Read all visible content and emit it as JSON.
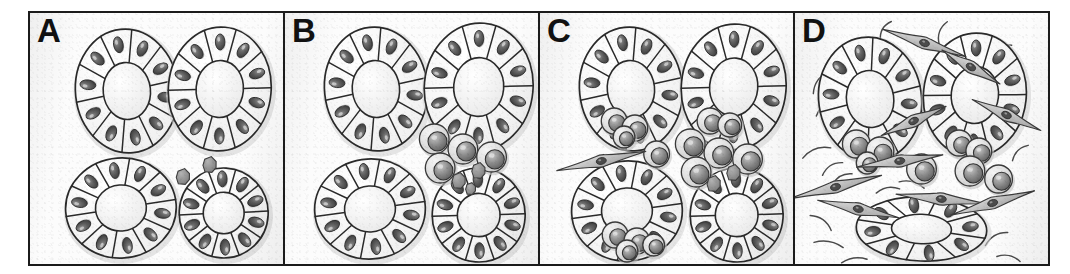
{
  "figure": {
    "panel_count": 4,
    "frame_color": "#1b1b1b",
    "background_color": "#fcfcfc"
  },
  "legend": {
    "acinus": "glandular acinus (ring of wedge-shaped epithelial cells around a central lumen)",
    "epithelial_nucleus": "dark oval basal nucleus",
    "lymphocyte": "round mononuclear infiltrating cell with pale cytoplasm and large nucleus",
    "plasma_cell": "small dark polygonal infiltrating cell",
    "fibroblast": "spindle-shaped cell with tapering processes",
    "collagen_fiber": "curved stromal fiber strand"
  },
  "panels": [
    {
      "id": "A",
      "label": "A",
      "stage": "normal",
      "description": "Four intact acini; two small dark infiltrating cells just appearing at the edge of one acinus",
      "counts": {
        "acini": 4,
        "lymphocytes": 0,
        "plasma_cells": 2,
        "fibroblasts": 0,
        "collagen_fibers": 0
      },
      "acini": [
        {
          "cx": 98,
          "cy": 78,
          "rx": 52,
          "ry": 62,
          "rot": -6,
          "cells": 10,
          "shape": "oval",
          "infiltrated": false
        },
        {
          "cx": 192,
          "cy": 76,
          "rx": 52,
          "ry": 62,
          "rot": 5,
          "cells": 10,
          "shape": "oval",
          "infiltrated": false
        },
        {
          "cx": 92,
          "cy": 195,
          "rx": 56,
          "ry": 50,
          "rot": -4,
          "cells": 10,
          "shape": "oval",
          "infiltrated": false
        },
        {
          "cx": 196,
          "cy": 200,
          "rx": 45,
          "ry": 45,
          "rot": 3,
          "cells": 10,
          "shape": "round",
          "infiltrated": false
        }
      ],
      "lymphocytes": [],
      "plasma_cells": [
        {
          "cx": 155,
          "cy": 164,
          "r": 8
        },
        {
          "cx": 182,
          "cy": 152,
          "r": 8
        }
      ],
      "fibroblasts": [],
      "collagen_fibers": []
    },
    {
      "id": "B",
      "label": "B",
      "stage": "early periductal infiltrate",
      "description": "Four intact acini with a focal cluster of mononuclear cells between them",
      "counts": {
        "acini": 4,
        "lymphocytes": 5,
        "plasma_cells": 3,
        "fibroblasts": 0,
        "collagen_fibers": 0
      },
      "acini": [
        {
          "cx": 92,
          "cy": 76,
          "rx": 52,
          "ry": 62,
          "rot": -6,
          "cells": 10,
          "shape": "oval",
          "infiltrated": false
        },
        {
          "cx": 196,
          "cy": 74,
          "rx": 55,
          "ry": 64,
          "rot": 5,
          "cells": 10,
          "shape": "oval",
          "infiltrated": false
        },
        {
          "cx": 86,
          "cy": 196,
          "rx": 56,
          "ry": 50,
          "rot": -3,
          "cells": 10,
          "shape": "oval",
          "infiltrated": false
        },
        {
          "cx": 196,
          "cy": 202,
          "rx": 47,
          "ry": 47,
          "rot": 4,
          "cells": 10,
          "shape": "round",
          "infiltrated": false
        }
      ],
      "lymphocytes": [
        {
          "cx": 151,
          "cy": 126,
          "r": 15
        },
        {
          "cx": 180,
          "cy": 136,
          "r": 15
        },
        {
          "cx": 209,
          "cy": 144,
          "r": 15
        },
        {
          "cx": 157,
          "cy": 155,
          "r": 15
        },
        {
          "cx": 186,
          "cy": 120,
          "r": 0
        }
      ],
      "plasma_cells": [
        {
          "cx": 196,
          "cy": 158,
          "r": 8
        },
        {
          "cx": 176,
          "cy": 168,
          "r": 8
        },
        {
          "cx": 188,
          "cy": 176,
          "r": 6
        }
      ],
      "fibroblasts": [],
      "collagen_fibers": []
    },
    {
      "id": "C",
      "label": "C",
      "stage": "expanded infiltrate with acinar invasion",
      "description": "Infiltrating cells increase, invade the walls of two acini; an early fibroblast appears",
      "counts": {
        "acini": 4,
        "lymphocytes": 14,
        "plasma_cells": 2,
        "fibroblasts": 1,
        "collagen_fibers": 0
      },
      "acini": [
        {
          "cx": 92,
          "cy": 76,
          "rx": 52,
          "ry": 62,
          "rot": -6,
          "cells": 10,
          "shape": "oval",
          "infiltrated": true
        },
        {
          "cx": 196,
          "cy": 74,
          "rx": 53,
          "ry": 63,
          "rot": 5,
          "cells": 10,
          "shape": "oval",
          "infiltrated": true
        },
        {
          "cx": 88,
          "cy": 198,
          "rx": 56,
          "ry": 50,
          "rot": -3,
          "cells": 10,
          "shape": "oval",
          "infiltrated": true
        },
        {
          "cx": 199,
          "cy": 202,
          "rx": 47,
          "ry": 47,
          "rot": 4,
          "cells": 10,
          "shape": "round",
          "infiltrated": false
        }
      ],
      "lymphocytes": [
        {
          "cx": 152,
          "cy": 131,
          "r": 15
        },
        {
          "cx": 181,
          "cy": 140,
          "r": 15
        },
        {
          "cx": 210,
          "cy": 146,
          "r": 15
        },
        {
          "cx": 158,
          "cy": 159,
          "r": 15
        },
        {
          "cx": 118,
          "cy": 141,
          "r": 13
        },
        {
          "cx": 75,
          "cy": 108,
          "r": 13
        },
        {
          "cx": 96,
          "cy": 115,
          "r": 13
        },
        {
          "cx": 85,
          "cy": 124,
          "r": 11
        },
        {
          "cx": 172,
          "cy": 108,
          "r": 13
        },
        {
          "cx": 192,
          "cy": 112,
          "r": 12
        },
        {
          "cx": 76,
          "cy": 222,
          "r": 13
        },
        {
          "cx": 98,
          "cy": 228,
          "r": 13
        },
        {
          "cx": 115,
          "cy": 232,
          "r": 11
        },
        {
          "cx": 88,
          "cy": 238,
          "r": 11
        }
      ],
      "plasma_cells": [
        {
          "cx": 196,
          "cy": 160,
          "r": 8
        },
        {
          "cx": 176,
          "cy": 171,
          "r": 8
        }
      ],
      "fibroblasts": [
        {
          "cx": 62,
          "cy": 148,
          "len": 46,
          "rot": -12
        }
      ],
      "collagen_fibers": []
    },
    {
      "id": "D",
      "label": "D",
      "stage": "fibrosis and acinar atrophy",
      "description": "Dense fibroblasts and collagen fibers replace the stroma; only three acini remain, the lower one flattened and atrophic",
      "counts": {
        "acini": 3,
        "lymphocytes": 9,
        "plasma_cells": 0,
        "fibroblasts": 9,
        "collagen_fibers": 22
      },
      "acini": [
        {
          "cx": 76,
          "cy": 86,
          "rx": 52,
          "ry": 62,
          "rot": -8,
          "cells": 10,
          "shape": "oval",
          "infiltrated": true
        },
        {
          "cx": 182,
          "cy": 82,
          "rx": 52,
          "ry": 62,
          "rot": 6,
          "cells": 10,
          "shape": "oval",
          "infiltrated": true
        },
        {
          "cx": 128,
          "cy": 216,
          "rx": 66,
          "ry": 32,
          "rot": 2,
          "cells": 8,
          "shape": "flattened",
          "infiltrated": false
        }
      ],
      "lymphocytes": [
        {
          "cx": 62,
          "cy": 131,
          "r": 14
        },
        {
          "cx": 86,
          "cy": 138,
          "r": 14
        },
        {
          "cx": 73,
          "cy": 150,
          "r": 11
        },
        {
          "cx": 128,
          "cy": 156,
          "r": 15
        },
        {
          "cx": 166,
          "cy": 130,
          "r": 13
        },
        {
          "cx": 186,
          "cy": 138,
          "r": 13
        },
        {
          "cx": 177,
          "cy": 158,
          "r": 15
        },
        {
          "cx": 206,
          "cy": 166,
          "r": 14
        },
        {
          "cx": 152,
          "cy": 121,
          "r": 0
        }
      ],
      "plasma_cells": [],
      "fibroblasts": [
        {
          "cx": 131,
          "cy": 30,
          "len": 44,
          "rot": 18
        },
        {
          "cx": 41,
          "cy": 174,
          "len": 48,
          "rot": -14
        },
        {
          "cx": 64,
          "cy": 196,
          "len": 42,
          "rot": 12
        },
        {
          "cx": 106,
          "cy": 148,
          "len": 44,
          "rot": -8
        },
        {
          "cx": 148,
          "cy": 186,
          "len": 46,
          "rot": 6
        },
        {
          "cx": 200,
          "cy": 190,
          "len": 44,
          "rot": -16
        },
        {
          "cx": 214,
          "cy": 102,
          "len": 38,
          "rot": 24
        },
        {
          "cx": 120,
          "cy": 108,
          "len": 36,
          "rot": -24
        },
        {
          "cx": 178,
          "cy": 54,
          "len": 34,
          "rot": 30
        }
      ],
      "collagen_fibers": [
        {
          "x": 26,
          "y": 70,
          "len": 26,
          "rot": -55,
          "curve": 8
        },
        {
          "x": 30,
          "y": 96,
          "len": 22,
          "rot": -40,
          "curve": 7
        },
        {
          "x": 22,
          "y": 140,
          "len": 30,
          "rot": -20,
          "curve": 9
        },
        {
          "x": 26,
          "y": 210,
          "len": 26,
          "rot": 35,
          "curve": 8
        },
        {
          "x": 34,
          "y": 232,
          "len": 30,
          "rot": 10,
          "curve": 7
        },
        {
          "x": 60,
          "y": 248,
          "len": 26,
          "rot": -8,
          "curve": 6
        },
        {
          "x": 38,
          "y": 156,
          "len": 24,
          "rot": -32,
          "curve": 8
        },
        {
          "x": 48,
          "y": 166,
          "len": 22,
          "rot": -28,
          "curve": 7
        },
        {
          "x": 92,
          "y": 18,
          "len": 22,
          "rot": -60,
          "curve": 8
        },
        {
          "x": 112,
          "y": 52,
          "len": 20,
          "rot": 70,
          "curve": 6
        },
        {
          "x": 150,
          "y": 20,
          "len": 24,
          "rot": -70,
          "curve": 8
        },
        {
          "x": 160,
          "y": 44,
          "len": 20,
          "rot": 60,
          "curve": 6
        },
        {
          "x": 138,
          "y": 96,
          "len": 22,
          "rot": -18,
          "curve": 7
        },
        {
          "x": 118,
          "y": 172,
          "len": 26,
          "rot": 14,
          "curve": 7
        },
        {
          "x": 94,
          "y": 178,
          "len": 24,
          "rot": -10,
          "curve": 7
        },
        {
          "x": 166,
          "y": 206,
          "len": 28,
          "rot": 22,
          "curve": 8
        },
        {
          "x": 204,
          "y": 226,
          "len": 26,
          "rot": -30,
          "curve": 8
        },
        {
          "x": 216,
          "y": 246,
          "len": 24,
          "rot": 12,
          "curve": 7
        },
        {
          "x": 222,
          "y": 60,
          "len": 24,
          "rot": 48,
          "curve": 8
        },
        {
          "x": 228,
          "y": 140,
          "len": 22,
          "rot": -44,
          "curve": 7
        },
        {
          "x": 210,
          "y": 36,
          "len": 20,
          "rot": -22,
          "curve": 6
        },
        {
          "x": 120,
          "y": 240,
          "len": 26,
          "rot": -6,
          "curve": 7
        }
      ]
    }
  ]
}
